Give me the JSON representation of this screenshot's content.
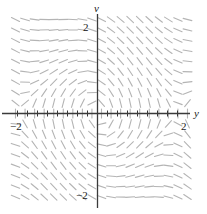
{
  "figure": {
    "kind": "direction-field",
    "width": 207,
    "height": 214,
    "background": "#ffffff"
  },
  "axes": {
    "horizontal": {
      "label": "y",
      "label_italic": true,
      "color": "#3a3a3a",
      "pixel_y": 113,
      "pixel_x_start": 2,
      "pixel_x_end": 190,
      "ticks_visible": true,
      "tick_spacing_units": 0.25,
      "tick_half_length_px": 3,
      "tick_labels": [
        {
          "text": "−2",
          "value": -2
        },
        {
          "text": "2",
          "value": 2
        }
      ]
    },
    "vertical": {
      "label": "v",
      "label_italic": true,
      "color": "#3a3a3a",
      "pixel_x": 97,
      "pixel_y_start": 14,
      "pixel_y_end": 208,
      "ticks_visible": false,
      "tick_labels": [
        {
          "text": "2",
          "value": 2
        },
        {
          "text": "−2",
          "value": -2
        }
      ]
    }
  },
  "chart_data": {
    "type": "quiver",
    "title": "",
    "xlabel": "y",
    "ylabel": "v",
    "xlim": [
      -2.15,
      2.35
    ],
    "ylim": [
      -2.45,
      2.45
    ],
    "grid": false,
    "legend": null,
    "field": {
      "description": "slope field dv/dy = -sin(y)/v style pendulum phase portrait with centers at (-1,1) and (1,-1)",
      "center_left": [
        -1.0,
        1.0
      ],
      "center_right": [
        1.0,
        -1.0
      ],
      "saddle": [
        0.0,
        0.0
      ],
      "segment_color": "#b4b4b4",
      "segment_length_px": 9,
      "segment_width_px": 1.1,
      "grid_cols": 19,
      "grid_rows": 19,
      "x_start": -2.05,
      "x_end": 2.25,
      "y_start": -2.35,
      "y_end": 2.35
    }
  },
  "colors": {
    "axis": "#3a3a3a",
    "segment": "#b4b4b4",
    "text": "#1a1a1a",
    "background": "#ffffff"
  }
}
